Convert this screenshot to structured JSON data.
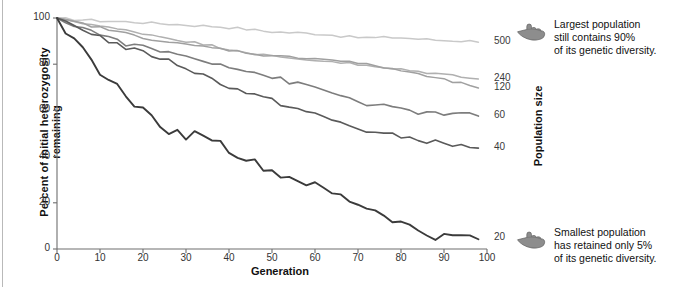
{
  "figure": {
    "ylabel": "Percent of initial heterozygosity remaining",
    "xlabel": "Generation",
    "right_axis_label": "Population size"
  },
  "annotations": {
    "top": {
      "icon": "pointing-hand-icon",
      "text": "Largest population\nstill contains 90%\nof its genetic diversity."
    },
    "bottom": {
      "icon": "pointing-hand-icon",
      "text": "Smallest population\nhas retained only 5%\nof its genetic diversity."
    }
  },
  "series_labels": [
    "500",
    "240",
    "120",
    "60",
    "40",
    "20"
  ],
  "chart_data": {
    "type": "line",
    "title": "",
    "xlabel": "Generation",
    "ylabel": "Percent of initial heterozygosity remaining",
    "xlim": [
      0,
      100
    ],
    "ylim": [
      0,
      100
    ],
    "xticks": [
      0,
      10,
      20,
      30,
      40,
      50,
      60,
      70,
      80,
      90,
      100
    ],
    "yticks": [
      0,
      20,
      40,
      60,
      80,
      100
    ],
    "grid": false,
    "legend": "right-endpoint-labels",
    "x": [
      0,
      2,
      4,
      6,
      8,
      10,
      12,
      14,
      16,
      18,
      20,
      22,
      24,
      26,
      28,
      30,
      32,
      34,
      36,
      38,
      40,
      42,
      44,
      46,
      48,
      50,
      52,
      54,
      56,
      58,
      60,
      62,
      64,
      66,
      68,
      70,
      72,
      74,
      76,
      78,
      80,
      82,
      84,
      86,
      88,
      90,
      92,
      94,
      96,
      98
    ],
    "series": [
      {
        "name": "500",
        "color": "#c9c9c9",
        "endpoint_label": "500",
        "final_value": 90,
        "values": [
          100,
          99.7,
          99.4,
          99.2,
          99.0,
          98.8,
          98.6,
          98.5,
          98.4,
          98.2,
          98.0,
          97.8,
          97.6,
          97.4,
          97.2,
          97.0,
          96.8,
          96.6,
          96.4,
          96.2,
          95.9,
          95.6,
          95.2,
          94.8,
          94.4,
          94.1,
          93.9,
          93.7,
          93.6,
          93.4,
          93.2,
          93.0,
          92.6,
          92.2,
          91.8,
          91.6,
          91.5,
          91.4,
          91.5,
          91.6,
          91.5,
          91.2,
          90.9,
          90.7,
          90.5,
          90.3,
          90.2,
          90.1,
          90.0,
          90.0
        ]
      },
      {
        "name": "240",
        "color": "#b0b0b0",
        "endpoint_label": "240",
        "final_value": 74,
        "values": [
          100,
          99.3,
          98.6,
          97.9,
          97.2,
          96.5,
          95.8,
          95.2,
          94.6,
          94.0,
          93.4,
          92.7,
          92.0,
          91.3,
          90.6,
          90.0,
          89.3,
          88.6,
          88.0,
          87.3,
          86.6,
          86.0,
          85.3,
          84.6,
          84.0,
          83.4,
          82.9,
          82.6,
          82.3,
          82.0,
          81.8,
          81.5,
          81.2,
          80.8,
          80.3,
          79.7,
          79.2,
          78.8,
          78.4,
          78.0,
          77.6,
          77.2,
          76.8,
          76.4,
          76.0,
          75.6,
          75.2,
          74.8,
          74.4,
          74.0
        ]
      },
      {
        "name": "120",
        "color": "#a0a0a0",
        "endpoint_label": "120",
        "final_value": 70,
        "values": [
          100,
          99.2,
          98.3,
          97.5,
          96.6,
          95.8,
          95.0,
          94.1,
          93.3,
          92.5,
          91.7,
          90.9,
          90.2,
          89.5,
          88.9,
          88.4,
          88.0,
          87.6,
          87.2,
          86.7,
          86.2,
          85.6,
          85.0,
          84.5,
          84.0,
          83.6,
          83.3,
          83.1,
          83.0,
          82.8,
          82.5,
          82.2,
          81.9,
          81.5,
          81.0,
          80.4,
          79.8,
          79.2,
          78.6,
          78.0,
          77.3,
          76.5,
          75.6,
          74.8,
          74.0,
          73.2,
          72.4,
          71.6,
          70.8,
          70.0
        ]
      },
      {
        "name": "60",
        "color": "#7d7d7d",
        "endpoint_label": "60",
        "final_value": 58,
        "values": [
          100,
          98.6,
          97.2,
          95.8,
          94.4,
          93.0,
          91.6,
          90.3,
          89.0,
          88.0,
          87.2,
          86.5,
          85.8,
          85.0,
          84.2,
          83.4,
          82.6,
          81.8,
          81.0,
          80.2,
          79.4,
          78.4,
          77.4,
          76.4,
          75.4,
          74.4,
          73.4,
          72.4,
          71.4,
          70.6,
          69.8,
          68.8,
          67.6,
          66.4,
          65.2,
          64.0,
          63.0,
          62.2,
          61.6,
          61.0,
          60.4,
          59.8,
          59.3,
          58.9,
          58.6,
          58.4,
          58.2,
          58.1,
          58.0,
          58.0
        ]
      },
      {
        "name": "40",
        "color": "#5a5a5a",
        "endpoint_label": "40",
        "final_value": 44,
        "values": [
          100,
          98.4,
          96.8,
          95.2,
          93.6,
          92.0,
          90.2,
          88.6,
          87.2,
          86.0,
          85.0,
          84.0,
          82.8,
          81.4,
          80.0,
          78.4,
          76.8,
          75.2,
          73.6,
          72.0,
          70.4,
          69.0,
          67.8,
          66.6,
          65.4,
          64.2,
          63.0,
          61.8,
          60.6,
          59.4,
          58.2,
          57.0,
          55.8,
          54.6,
          53.4,
          52.2,
          51.2,
          50.4,
          49.8,
          49.2,
          48.6,
          48.0,
          47.4,
          46.8,
          46.2,
          45.6,
          45.0,
          44.6,
          44.3,
          44.0
        ]
      },
      {
        "name": "20",
        "color": "#3b3b3b",
        "endpoint_label": "20",
        "final_value": 5,
        "values": [
          100,
          95.0,
          90.0,
          85.5,
          81.0,
          77.0,
          73.0,
          70.0,
          67.0,
          63.0,
          60.0,
          57.0,
          54.0,
          51.5,
          50.0,
          49.0,
          49.5,
          50.0,
          48.0,
          45.5,
          43.0,
          41.0,
          39.0,
          37.0,
          35.5,
          33.5,
          32.0,
          31.0,
          30.0,
          28.5,
          27.0,
          25.5,
          24.0,
          22.5,
          21.0,
          19.5,
          18.0,
          16.5,
          15.0,
          13.0,
          11.0,
          9.5,
          8.0,
          6.5,
          5.5,
          5.0,
          5.0,
          5.2,
          5.0,
          4.5
        ]
      }
    ]
  }
}
